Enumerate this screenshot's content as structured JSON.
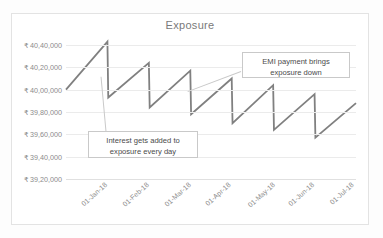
{
  "document_fragment": "",
  "chart": {
    "title": "Exposure",
    "annotations": [
      {
        "id": "emi",
        "text": "EMI payment brings exposure down"
      },
      {
        "id": "interest",
        "text": "Interest gets added to exposure every day"
      }
    ]
  },
  "chart_data": {
    "type": "line",
    "title": "Exposure",
    "xlabel": "",
    "ylabel": "",
    "grid": true,
    "legend": "none",
    "ylim": [
      3920000,
      4040000
    ],
    "ytick_values": [
      4040000,
      4020000,
      4000000,
      3980000,
      3960000,
      3940000,
      3920000
    ],
    "ytick_labels": [
      "₹ 40,40,000",
      "₹ 40,20,000",
      "₹ 40,00,000",
      "₹ 39,80,000",
      "₹ 39,60,000",
      "₹ 39,40,000",
      "₹ 39,20,000"
    ],
    "xtick_labels": [
      "01-Jan-18",
      "01-Feb-18",
      "01-Mar-18",
      "01-Apr-18",
      "01-May-18",
      "01-Jun-18",
      "01-Jul-18"
    ],
    "series": [
      {
        "name": "Exposure",
        "color": "#808080",
        "description": "Daily loan exposure: interest accrues upward each day, EMI payment drops it at each month start; overall trend declines.",
        "points": [
          {
            "x": 0.0,
            "y": 4000000
          },
          {
            "x": 1.0,
            "y": 4043000
          },
          {
            "x": 1.02,
            "y": 3993000
          },
          {
            "x": 2.0,
            "y": 4024000
          },
          {
            "x": 2.02,
            "y": 3984000
          },
          {
            "x": 3.0,
            "y": 4017000
          },
          {
            "x": 3.02,
            "y": 3978000
          },
          {
            "x": 4.0,
            "y": 4010000
          },
          {
            "x": 4.02,
            "y": 3970000
          },
          {
            "x": 5.0,
            "y": 4004000
          },
          {
            "x": 5.02,
            "y": 3964000
          },
          {
            "x": 6.0,
            "y": 3996000
          },
          {
            "x": 6.02,
            "y": 3957000
          },
          {
            "x": 7.0,
            "y": 3988000
          }
        ]
      }
    ]
  }
}
